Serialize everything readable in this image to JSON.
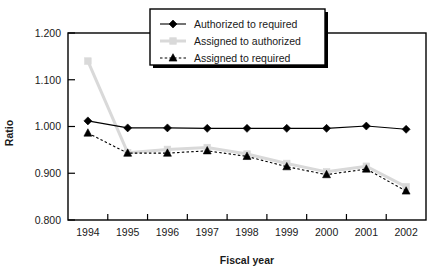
{
  "chart_data": {
    "type": "line",
    "title": "",
    "xlabel": "Fiscal year",
    "ylabel": "Ratio",
    "categories": [
      "1994",
      "1995",
      "1996",
      "1997",
      "1998",
      "1999",
      "2000",
      "2001",
      "2002"
    ],
    "x": [
      1994,
      1995,
      1996,
      1997,
      1998,
      1999,
      2000,
      2001,
      2002
    ],
    "ylim": [
      0.8,
      1.2
    ],
    "yticks": [
      0.8,
      0.9,
      1.0,
      1.1,
      1.2
    ],
    "ytick_labels": [
      "0.800",
      "0.900",
      "1.000",
      "1.100",
      "1.200"
    ],
    "grid": false,
    "legend_position": "top-center",
    "series": [
      {
        "name": "Authorized to required",
        "marker": "diamond",
        "color": "#000000",
        "line_style": "solid",
        "values": [
          1.012,
          0.997,
          0.997,
          0.996,
          0.996,
          0.996,
          0.996,
          1.001,
          0.994
        ]
      },
      {
        "name": "Assigned to authorized",
        "marker": "square",
        "color": "#d9d9d9",
        "line_style": "solid",
        "values": [
          1.14,
          0.944,
          0.951,
          0.955,
          0.941,
          0.921,
          0.903,
          0.915,
          0.871
        ]
      },
      {
        "name": "Assigned to required",
        "marker": "triangle",
        "color": "#000000",
        "line_style": "dashed",
        "values": [
          0.986,
          0.943,
          0.943,
          0.948,
          0.936,
          0.914,
          0.897,
          0.909,
          0.862
        ]
      }
    ]
  },
  "axes": {
    "y_title": "Ratio",
    "x_title": "Fiscal year"
  },
  "legend": {
    "items": [
      {
        "label": "Authorized to required"
      },
      {
        "label": "Assigned to authorized"
      },
      {
        "label": "Assigned to required"
      }
    ]
  },
  "colors": {
    "axis": "#000000",
    "series_dark": "#000000",
    "series_light": "#d9d9d9",
    "background": "#ffffff",
    "legend_border": "#000000",
    "legend_shadow": "#000000"
  }
}
